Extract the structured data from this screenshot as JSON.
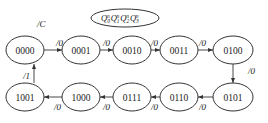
{
  "diagram": {
    "type": "state-transition",
    "output_label": "/C",
    "legend": {
      "variables": [
        {
          "base": "Q",
          "sub": "0",
          "sup": "n"
        },
        {
          "base": "Q",
          "sub": "1",
          "sup": "n"
        },
        {
          "base": "Q",
          "sub": "2",
          "sup": "n"
        },
        {
          "base": "Q",
          "sub": "3",
          "sup": "n"
        }
      ]
    },
    "states": [
      {
        "id": "s0",
        "label": "0000"
      },
      {
        "id": "s1",
        "label": "0001"
      },
      {
        "id": "s2",
        "label": "0010"
      },
      {
        "id": "s3",
        "label": "0011"
      },
      {
        "id": "s4",
        "label": "0100"
      },
      {
        "id": "s5",
        "label": "0101"
      },
      {
        "id": "s6",
        "label": "0110"
      },
      {
        "id": "s7",
        "label": "0111"
      },
      {
        "id": "s8",
        "label": "1000"
      },
      {
        "id": "s9",
        "label": "1001"
      }
    ],
    "transitions": [
      {
        "from": "0000",
        "to": "0001",
        "label": "/0"
      },
      {
        "from": "0001",
        "to": "0010",
        "label": "/0"
      },
      {
        "from": "0010",
        "to": "0011",
        "label": "/0"
      },
      {
        "from": "0011",
        "to": "0100",
        "label": "/0"
      },
      {
        "from": "0100",
        "to": "0101",
        "label": "/0"
      },
      {
        "from": "0101",
        "to": "0110",
        "label": "/0"
      },
      {
        "from": "0110",
        "to": "0111",
        "label": "/0"
      },
      {
        "from": "0111",
        "to": "1000",
        "label": "/0"
      },
      {
        "from": "1000",
        "to": "1001",
        "label": "/0"
      },
      {
        "from": "1001",
        "to": "0000",
        "label": "/1"
      }
    ]
  }
}
